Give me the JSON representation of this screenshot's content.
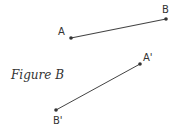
{
  "figure": {
    "caption": "Figure B",
    "colors": {
      "line": "#444444",
      "point": "#333333",
      "text": "#333333"
    },
    "segments": [
      {
        "name": "AB",
        "start": {
          "label": "A",
          "x": 71,
          "y": 38,
          "label_x": 58,
          "label_y": 35
        },
        "end": {
          "label": "B",
          "x": 166,
          "y": 19,
          "label_x": 162,
          "label_y": 13
        }
      },
      {
        "name": "A'B'",
        "start": {
          "label": "A'",
          "x": 140,
          "y": 64,
          "label_x": 143,
          "label_y": 61
        },
        "end": {
          "label": "B'",
          "x": 56,
          "y": 110,
          "label_x": 53,
          "label_y": 124
        }
      }
    ]
  }
}
